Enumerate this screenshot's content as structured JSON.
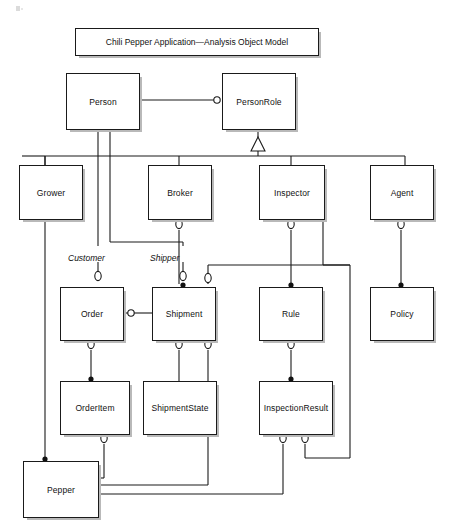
{
  "diagram": {
    "title": "Chili Pepper Application—Analysis Object Model",
    "type": "uml-analysis-object-model",
    "background_color": "#ffffff",
    "line_color": "#1a1a1a",
    "shadow_color": "#b9b9b9"
  },
  "nodes": [
    {
      "id": "person",
      "label": "Person",
      "x": 66,
      "y": 73,
      "w": 72,
      "h": 55
    },
    {
      "id": "personrole",
      "label": "PersonRole",
      "x": 222,
      "y": 73,
      "w": 72,
      "h": 55
    },
    {
      "id": "grower",
      "label": "Grower",
      "x": 19,
      "y": 165,
      "w": 62,
      "h": 53
    },
    {
      "id": "broker",
      "label": "Broker",
      "x": 148,
      "y": 165,
      "w": 62,
      "h": 53
    },
    {
      "id": "inspector",
      "label": "Inspector",
      "x": 259,
      "y": 165,
      "w": 64,
      "h": 53
    },
    {
      "id": "agent",
      "label": "Agent",
      "x": 370,
      "y": 165,
      "w": 62,
      "h": 53
    },
    {
      "id": "order",
      "label": "Order",
      "x": 60,
      "y": 287,
      "w": 62,
      "h": 52
    },
    {
      "id": "shipment",
      "label": "Shipment",
      "x": 152,
      "y": 287,
      "w": 62,
      "h": 52
    },
    {
      "id": "rule",
      "label": "Rule",
      "x": 259,
      "y": 287,
      "w": 62,
      "h": 52
    },
    {
      "id": "policy",
      "label": "Policy",
      "x": 370,
      "y": 287,
      "w": 62,
      "h": 52
    },
    {
      "id": "orderitem",
      "label": "OrderItem",
      "x": 60,
      "y": 381,
      "w": 68,
      "h": 52
    },
    {
      "id": "shipmentstate",
      "label": "ShipmentState",
      "x": 143,
      "y": 381,
      "w": 72,
      "h": 52
    },
    {
      "id": "inspectionresult",
      "label": "InspectionResult",
      "x": 259,
      "y": 381,
      "w": 72,
      "h": 52
    },
    {
      "id": "pepper",
      "label": "Pepper",
      "x": 23,
      "y": 461,
      "w": 74,
      "h": 55
    }
  ],
  "role_labels": [
    {
      "id": "customer",
      "text": "Customer",
      "x": 68,
      "y": 253
    },
    {
      "id": "shipper",
      "text": "Shipper",
      "x": 150,
      "y": 253
    }
  ],
  "relationships": [
    {
      "from": "person",
      "to": "personrole",
      "marker": "hollow-circle",
      "kind": "association"
    },
    {
      "from": "personrole",
      "to": "grower",
      "marker": "generalization-triangle",
      "kind": "generalization"
    },
    {
      "from": "personrole",
      "to": "broker",
      "marker": "generalization-triangle",
      "kind": "generalization"
    },
    {
      "from": "personrole",
      "to": "inspector",
      "marker": "generalization-triangle",
      "kind": "generalization"
    },
    {
      "from": "personrole",
      "to": "agent",
      "marker": "generalization-triangle",
      "kind": "generalization"
    },
    {
      "from": "person",
      "to": "order",
      "marker": "hollow-circle",
      "role": "Customer"
    },
    {
      "from": "person",
      "to": "shipment",
      "marker": "hollow-circle",
      "role": "Shipper"
    },
    {
      "from": "broker",
      "to": "shipment",
      "marker": "filled-dot",
      "kind": "association"
    },
    {
      "from": "inspector",
      "to": "rule",
      "marker": "filled-dot",
      "kind": "association"
    },
    {
      "from": "agent",
      "to": "policy",
      "marker": "filled-dot",
      "kind": "association"
    },
    {
      "from": "order",
      "to": "shipment",
      "marker": "hollow-circle",
      "kind": "association"
    },
    {
      "from": "order",
      "to": "orderitem",
      "marker": "filled-dot",
      "kind": "composition"
    },
    {
      "from": "shipment",
      "to": "shipmentstate",
      "marker": "hollow-circle",
      "kind": "association"
    },
    {
      "from": "rule",
      "to": "inspectionresult",
      "marker": "filled-dot",
      "kind": "association"
    },
    {
      "from": "grower",
      "to": "pepper",
      "marker": "filled-dot",
      "kind": "association"
    },
    {
      "from": "orderitem",
      "to": "pepper",
      "marker": "hollow-circle",
      "kind": "association"
    },
    {
      "from": "shipment",
      "to": "pepper",
      "marker": "hollow-circle",
      "kind": "association"
    },
    {
      "from": "inspectionresult",
      "to": "pepper",
      "marker": "hollow-circle",
      "kind": "association"
    },
    {
      "from": "inspector",
      "to": "inspectionresult",
      "marker": "hollow-circle",
      "kind": "association"
    }
  ]
}
